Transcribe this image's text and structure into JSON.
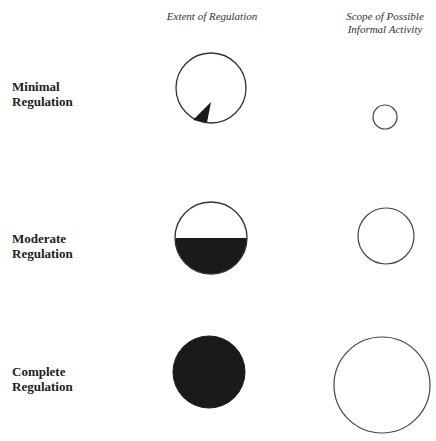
{
  "headers": {
    "extent": "Extent of Regulation",
    "scope_line1": "Scope of Possible",
    "scope_line2": "Informal Activity"
  },
  "rows": [
    {
      "label_line1": "Minimal",
      "label_line2": "Regulation",
      "extent_fill": "small wedge",
      "scope_size": "small"
    },
    {
      "label_line1": "Moderate",
      "label_line2": "Regulation",
      "extent_fill": "lower half",
      "scope_size": "medium"
    },
    {
      "label_line1": "Complete",
      "label_line2": "Regulation",
      "extent_fill": "full",
      "scope_size": "large"
    }
  ],
  "colors": {
    "stroke": "#333333",
    "fill": "#1a1a1a",
    "background": "#ffffff"
  }
}
